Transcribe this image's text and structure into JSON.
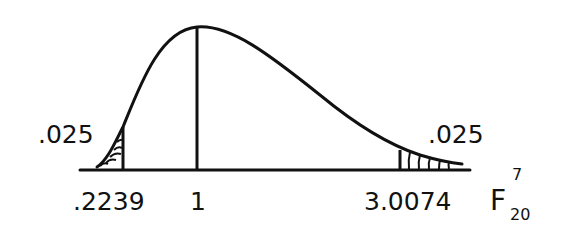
{
  "diagram": {
    "distribution": "F",
    "df_numerator": 7,
    "df_denominator": 20,
    "curve_label_base": "F",
    "curve_label_sup": "7",
    "curve_label_sub": "20",
    "left_tail_area": ".025",
    "right_tail_area": ".025",
    "axis_ticks": [
      {
        "label": ".2239",
        "value": 0.2239
      },
      {
        "label": "1",
        "value": 1
      },
      {
        "label": "3.0074",
        "value": 3.0074
      }
    ],
    "stroke_color": "#111111",
    "background": "#ffffff"
  }
}
